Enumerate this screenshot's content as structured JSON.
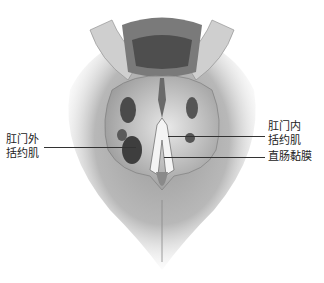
{
  "figure": {
    "type": "anatomical-illustration",
    "labels": {
      "left": {
        "line1": "肛门外",
        "line2": "括约肌"
      },
      "right_top": {
        "line1": "肛门内",
        "line2": "括约肌"
      },
      "right_bottom": {
        "text": "直肠黏膜"
      }
    }
  }
}
